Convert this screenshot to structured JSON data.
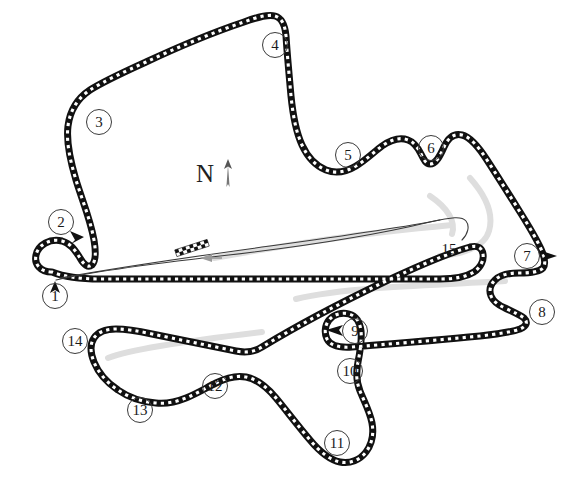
{
  "map": {
    "title": "Sepang International Circuit layout diagram",
    "width": 586,
    "height": 491,
    "background_color": "#ffffff",
    "track_color": "#111111",
    "kerb_color": "#ffffff",
    "shadow_color": "#d9d9d9",
    "pitlane_color": "#2b2b2b",
    "label_color": "#1a1a1a"
  },
  "compass": {
    "label": "N",
    "icon": "north-arrow-icon",
    "x": 196,
    "y": 158
  },
  "start_finish": {
    "icon": "checkered-flag-marker",
    "x": 192,
    "y": 248,
    "direction_arrow": "direction-arrow-icon"
  },
  "turns": [
    {
      "number": "1",
      "x": 55,
      "y": 296,
      "circled": true,
      "arrow": "up"
    },
    {
      "number": "2",
      "x": 61,
      "y": 222,
      "circled": true,
      "arrow": "down-right"
    },
    {
      "number": "3",
      "x": 99,
      "y": 122,
      "circled": true,
      "arrow": null
    },
    {
      "number": "4",
      "x": 275,
      "y": 45,
      "circled": true,
      "arrow": null
    },
    {
      "number": "5",
      "x": 348,
      "y": 155,
      "circled": true,
      "arrow": null
    },
    {
      "number": "6",
      "x": 431,
      "y": 148,
      "circled": true,
      "arrow": null
    },
    {
      "number": "7",
      "x": 527,
      "y": 256,
      "circled": true,
      "arrow": "right"
    },
    {
      "number": "8",
      "x": 542,
      "y": 312,
      "circled": true,
      "arrow": null
    },
    {
      "number": "9",
      "x": 355,
      "y": 331,
      "circled": true,
      "arrow": "left"
    },
    {
      "number": "10",
      "x": 350,
      "y": 371,
      "circled": true,
      "arrow": null
    },
    {
      "number": "11",
      "x": 337,
      "y": 443,
      "circled": true,
      "arrow": null
    },
    {
      "number": "12",
      "x": 215,
      "y": 386,
      "circled": true,
      "arrow": null
    },
    {
      "number": "13",
      "x": 140,
      "y": 410,
      "circled": true,
      "arrow": null
    },
    {
      "number": "14",
      "x": 75,
      "y": 341,
      "circled": true,
      "arrow": null
    },
    {
      "number": "15",
      "x": 449,
      "y": 249,
      "circled": false,
      "arrow": null
    }
  ],
  "turn_count": 15
}
